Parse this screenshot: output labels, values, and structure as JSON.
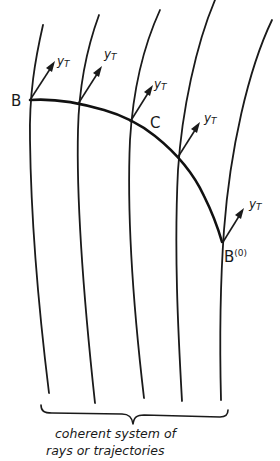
{
  "figure": {
    "type": "diagram",
    "points": {
      "B": "B",
      "C": "C",
      "B0_base": "B",
      "B0_sup": "(0)"
    },
    "vector_label_main": "y",
    "vector_label_sub": "T",
    "vector_labels": [
      "yT",
      "yT",
      "yT",
      "yT",
      "yT"
    ],
    "caption": {
      "line1": "coherent system of",
      "line2": "rays or trajectories"
    },
    "ray_count": 5,
    "colors": {
      "ink": "#1a1a1a",
      "background": "#ffffff"
    }
  }
}
